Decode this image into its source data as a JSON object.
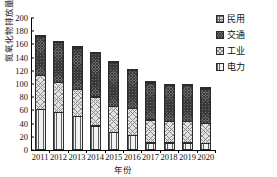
{
  "chart_data": {
    "type": "bar",
    "subtype": "stacked-bar",
    "title": "",
    "xlabel": "年份",
    "ylabel": "氮氧化物排放量/万吨",
    "categories": [
      "2011",
      "2012",
      "2013",
      "2014",
      "2015",
      "2016",
      "2017",
      "2018",
      "2019",
      "2020"
    ],
    "ylim": [
      0,
      200
    ],
    "yticks": [
      0,
      20,
      40,
      60,
      80,
      100,
      120,
      140,
      160,
      180,
      200
    ],
    "grid": false,
    "legend_position": "right",
    "stack_order_bottom_to_top": [
      "电力",
      "工业",
      "交通",
      "民用"
    ],
    "series": [
      {
        "name": "电力",
        "pattern": "vertical-lines",
        "color": "#f2f2f2",
        "values": [
          62,
          57,
          51,
          37,
          27,
          23,
          11,
          11,
          11,
          10
        ]
      },
      {
        "name": "工业",
        "pattern": "light-crosshatch",
        "color": "#e2e2e2",
        "values": [
          53,
          47,
          42,
          45,
          40,
          41,
          36,
          34,
          34,
          32
        ]
      },
      {
        "name": "交通",
        "pattern": "dark-checker",
        "color": "#6e6e6e",
        "values": [
          60,
          62,
          64,
          67,
          68,
          59,
          57,
          55,
          55,
          53
        ]
      },
      {
        "name": "民用",
        "pattern": "light-dots",
        "color": "#d8d8d8",
        "values": [
          3,
          3,
          3,
          3,
          3,
          2,
          2,
          2,
          2,
          2
        ]
      }
    ],
    "totals": [
      178,
      169,
      160,
      152,
      138,
      125,
      106,
      102,
      102,
      97
    ]
  },
  "legend": {
    "items": [
      {
        "label": "民用"
      },
      {
        "label": "交通"
      },
      {
        "label": "工业"
      },
      {
        "label": "电力"
      }
    ]
  }
}
